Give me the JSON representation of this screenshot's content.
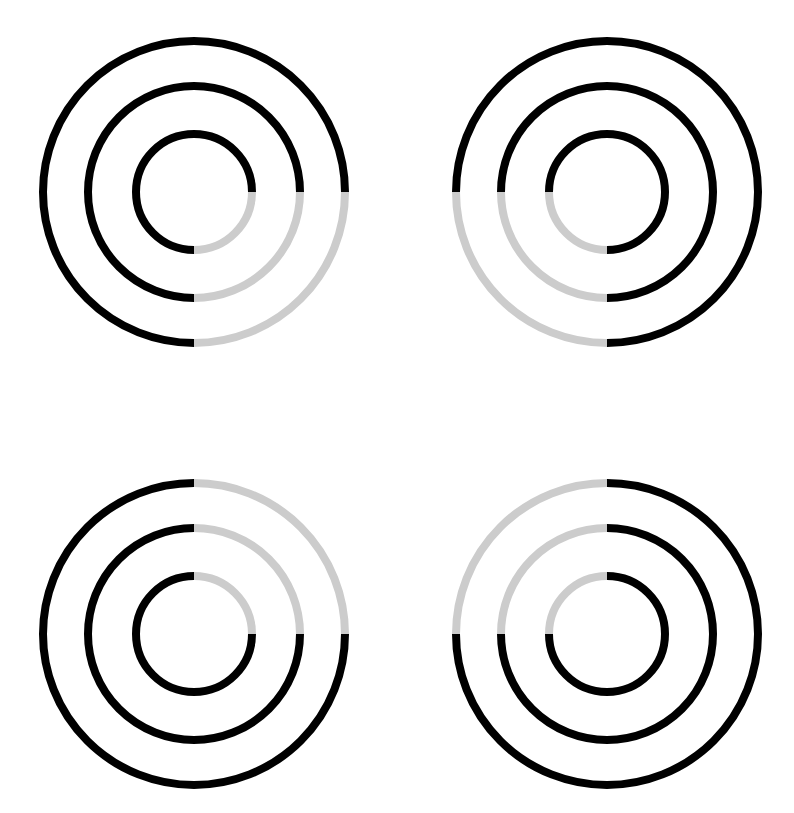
{
  "canvas": {
    "width": 794,
    "height": 813,
    "background_color": "#FFFFFF",
    "description": "Four concentric-ring figures arranged in a two-by-two grid"
  },
  "style": {
    "dark_color": "#000000",
    "light_color": "#CCCCCC",
    "stroke_width": 8,
    "ring_radii": [
      151,
      106,
      58
    ]
  },
  "figures": [
    {
      "id": "figure-top-left",
      "label": "Top left concentric rings",
      "grid_position": "top-left",
      "center_x": 194,
      "center_y": 192,
      "light_quadrant": "lower-right",
      "light_start_deg": 0,
      "light_end_deg": 90,
      "rings": [
        {
          "id": "outer",
          "radius": 151
        },
        {
          "id": "middle",
          "radius": 106
        },
        {
          "id": "inner",
          "radius": 58
        }
      ]
    },
    {
      "id": "figure-top-right",
      "label": "Top right concentric rings",
      "grid_position": "top-right",
      "center_x": 607,
      "center_y": 192,
      "light_quadrant": "lower-left",
      "light_start_deg": 90,
      "light_end_deg": 180,
      "rings": [
        {
          "id": "outer",
          "radius": 151
        },
        {
          "id": "middle",
          "radius": 106
        },
        {
          "id": "inner",
          "radius": 58
        }
      ]
    },
    {
      "id": "figure-bottom-left",
      "label": "Bottom left concentric rings",
      "grid_position": "bottom-left",
      "center_x": 194,
      "center_y": 634,
      "light_quadrant": "upper-right",
      "light_start_deg": 270,
      "light_end_deg": 360,
      "rings": [
        {
          "id": "outer",
          "radius": 151
        },
        {
          "id": "middle",
          "radius": 106
        },
        {
          "id": "inner",
          "radius": 58
        }
      ]
    },
    {
      "id": "figure-bottom-right",
      "label": "Bottom right concentric rings",
      "grid_position": "bottom-right",
      "center_x": 607,
      "center_y": 634,
      "light_quadrant": "upper-left",
      "light_start_deg": 180,
      "light_end_deg": 270,
      "rings": [
        {
          "id": "outer",
          "radius": 151
        },
        {
          "id": "middle",
          "radius": 106
        },
        {
          "id": "inner",
          "radius": 58
        }
      ]
    }
  ]
}
